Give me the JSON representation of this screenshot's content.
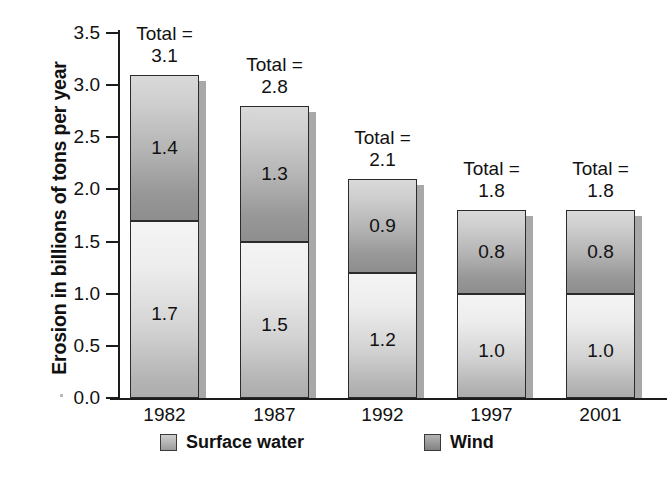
{
  "chart_data": {
    "type": "bar",
    "subtype": "stacked-vertical",
    "title": "",
    "xlabel": "",
    "ylabel": "Erosion in billions of tons per year",
    "categories": [
      "1982",
      "1987",
      "1992",
      "1997",
      "2001"
    ],
    "series": [
      {
        "name": "Surface water",
        "values": [
          1.7,
          1.5,
          1.2,
          1.0,
          1.0
        ]
      },
      {
        "name": "Wind",
        "values": [
          1.4,
          1.3,
          0.9,
          0.8,
          0.8
        ]
      }
    ],
    "totals": [
      3.1,
      2.8,
      2.1,
      1.8,
      1.8
    ],
    "total_label_prefix": "Total =",
    "ylim": [
      0.0,
      3.5
    ],
    "ytick_labels": [
      "3.5",
      "3.0",
      "2.5",
      "2.0",
      "1.5",
      "1.0",
      "0.5",
      "0.0"
    ],
    "ytick_values": [
      3.5,
      3.0,
      2.5,
      2.0,
      1.5,
      1.0,
      0.5,
      0.0
    ],
    "grid": false,
    "legend_position": "bottom",
    "colors": {
      "surface_water_light": "#f4f4f4",
      "surface_water_dark": "#acacac",
      "wind_light": "#d9d9d9",
      "wind_dark": "#8e8e8e",
      "axis": "#1c1c1c",
      "border": "#2b2b2b",
      "background": "#ffffff",
      "shadow": "#a8a8a8"
    }
  },
  "axis": {
    "y_title": "Erosion in billions of tons per year"
  },
  "legend": {
    "items": [
      {
        "label": "Surface water",
        "swatch": "surface-water-swatch"
      },
      {
        "label": "Wind",
        "swatch": "wind-swatch"
      }
    ]
  },
  "bars": [
    {
      "category": "1982",
      "total_line1": "Total =",
      "total_line2": "3.1",
      "water_value": "1.7",
      "wind_value": "1.4"
    },
    {
      "category": "1987",
      "total_line1": "Total =",
      "total_line2": "2.8",
      "water_value": "1.5",
      "wind_value": "1.3"
    },
    {
      "category": "1992",
      "total_line1": "Total =",
      "total_line2": "2.1",
      "water_value": "1.2",
      "wind_value": "0.9"
    },
    {
      "category": "1997",
      "total_line1": "Total =",
      "total_line2": "1.8",
      "water_value": "1.0",
      "wind_value": "0.8"
    },
    {
      "category": "2001",
      "total_line1": "Total =",
      "total_line2": "1.8",
      "water_value": "1.0",
      "wind_value": "0.8"
    }
  ],
  "yticks": [
    {
      "label": "3.5"
    },
    {
      "label": "3.0"
    },
    {
      "label": "2.5"
    },
    {
      "label": "2.0"
    },
    {
      "label": "1.5"
    },
    {
      "label": "1.0"
    },
    {
      "label": "0.5"
    },
    {
      "label": "0.0"
    }
  ]
}
